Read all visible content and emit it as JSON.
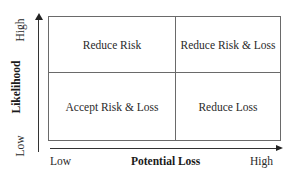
{
  "diagram": {
    "type": "risk-matrix-2x2",
    "x_axis": {
      "title": "Potential Loss",
      "low_label": "Low",
      "high_label": "High"
    },
    "y_axis": {
      "title": "Likelihood",
      "low_label": "Low",
      "high_label": "High"
    },
    "quadrants": {
      "high_likelihood_low_loss": "Reduce Risk",
      "high_likelihood_high_loss": "Reduce Risk & Loss",
      "low_likelihood_low_loss": "Accept Risk & Loss",
      "low_likelihood_high_loss": "Reduce Loss"
    },
    "colors": {
      "line": "#6a6a6a",
      "axis": "#333333",
      "text": "#2a2a2a"
    }
  }
}
